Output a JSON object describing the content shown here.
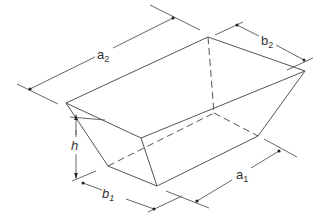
{
  "figure": {
    "shape": "open-top trapezoidal prismoid"
  },
  "labels": {
    "a2": {
      "base": "a",
      "sub": "2"
    },
    "b2": {
      "base": "b",
      "sub": "2"
    },
    "h": {
      "base": "h",
      "sub": ""
    },
    "b1": {
      "base": "b",
      "sub": "1"
    },
    "a1": {
      "base": "a",
      "sub": "1"
    }
  },
  "colors": {
    "line": "#555555",
    "text": "#333333",
    "background": "#ffffff"
  }
}
